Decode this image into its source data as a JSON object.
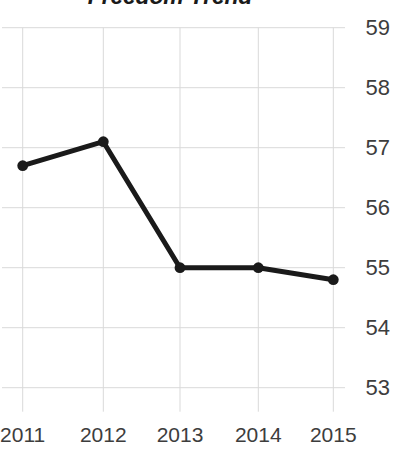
{
  "chart_data": {
    "type": "line",
    "title": "Freedom Trend",
    "xlabel": "",
    "ylabel": "",
    "categories": [
      "2011",
      "2012",
      "2013",
      "2014",
      "2015"
    ],
    "x": [
      2011,
      2012,
      2013,
      2014,
      2015
    ],
    "values": [
      56.7,
      57.1,
      55.0,
      55.0,
      54.8
    ],
    "series": [
      {
        "name": "Freedom score",
        "values": [
          56.7,
          57.1,
          55.0,
          55.0,
          54.8
        ]
      }
    ],
    "ylim": [
      53,
      59
    ],
    "yticks": [
      59,
      58,
      57,
      56,
      55,
      54,
      53
    ],
    "ytick_labels": [
      "59",
      "58",
      "57",
      "56",
      "55",
      "54",
      "53"
    ],
    "xtick_labels": [
      "2011",
      "2012",
      "2013",
      "2014",
      "2015"
    ],
    "y_axis_position": "right",
    "grid": true,
    "grid_axis": "both",
    "legend": false,
    "legend_position": "none",
    "marker": "circle",
    "colors": {
      "line": "#1a1a1a",
      "marker": "#1a1a1a",
      "grid": "#d9d9d9",
      "tick_label": "#3d3d3d",
      "title": "#1a1a1a",
      "background": "#ffffff"
    }
  }
}
